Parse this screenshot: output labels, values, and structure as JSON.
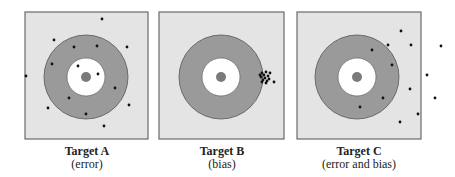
{
  "colors": {
    "board_fill": "#e4e4e4",
    "board_stroke": "#6a6a6a",
    "ring_fill": "#9a9a9a",
    "inner_fill": "#ffffff",
    "bullseye_fill": "#7a7a7a",
    "dot": "#111111"
  },
  "targets": [
    {
      "title": "Target A",
      "subtitle": "(error)",
      "board": {
        "x": 25,
        "y": 12,
        "w": 123,
        "h": 127
      },
      "center": [
        86,
        77
      ],
      "outer_r": 42,
      "inner_r": 19,
      "bull_r": 5,
      "shots": [
        [
          102,
          19
        ],
        [
          54,
          40
        ],
        [
          74,
          47
        ],
        [
          97,
          46
        ],
        [
          127,
          47
        ],
        [
          52,
          64
        ],
        [
          78,
          66
        ],
        [
          98,
          74
        ],
        [
          26,
          76
        ],
        [
          115,
          88
        ],
        [
          69,
          98
        ],
        [
          129,
          105
        ],
        [
          48,
          108
        ],
        [
          86,
          114
        ],
        [
          104,
          126
        ]
      ]
    },
    {
      "title": "Target B",
      "subtitle": "(bias)",
      "board": {
        "x": 159,
        "y": 12,
        "w": 125,
        "h": 127
      },
      "center": [
        221,
        77
      ],
      "outer_r": 42,
      "inner_r": 19,
      "bull_r": 5,
      "shots": [
        [
          262,
          73
        ],
        [
          264,
          75
        ],
        [
          266,
          72
        ],
        [
          261,
          77
        ],
        [
          265,
          78
        ],
        [
          268,
          76
        ],
        [
          263,
          80
        ],
        [
          267,
          81
        ],
        [
          260,
          75
        ],
        [
          270,
          73
        ],
        [
          269,
          79
        ],
        [
          266,
          83
        ],
        [
          262,
          82
        ],
        [
          274,
          82
        ]
      ]
    },
    {
      "title": "Target C",
      "subtitle": "(error and bias)",
      "board": {
        "x": 297,
        "y": 12,
        "w": 124,
        "h": 127
      },
      "center": [
        357,
        77
      ],
      "outer_r": 42,
      "inner_r": 19,
      "bull_r": 5,
      "shots": [
        [
          401,
          31
        ],
        [
          372,
          50
        ],
        [
          388,
          45
        ],
        [
          411,
          45
        ],
        [
          441,
          46
        ],
        [
          392,
          65
        ],
        [
          427,
          75
        ],
        [
          410,
          89
        ],
        [
          383,
          98
        ],
        [
          435,
          98
        ],
        [
          360,
          107
        ],
        [
          418,
          114
        ],
        [
          400,
          122
        ]
      ]
    }
  ]
}
